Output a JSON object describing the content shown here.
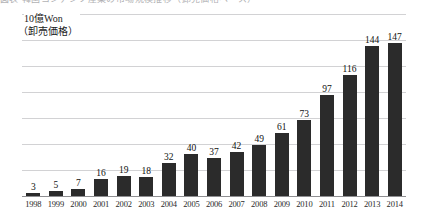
{
  "top_fragment": {
    "text": "図表  韓国コンテンツ産業の市場規模推移（卸売価格ベース）"
  },
  "y_axis_caption": {
    "line1": "10億Won",
    "line2": "（卸売価格）"
  },
  "style": {
    "bar_color": "#2b2b2b",
    "gridline_color": "#d2d2d4",
    "baseline_color": "#8f8f92",
    "label_color": "#111111",
    "background": "#ffffff"
  },
  "chart_data": {
    "type": "bar",
    "title": "",
    "subtitle": "",
    "xlabel": "",
    "ylabel": "10億Won（卸売価格）",
    "categories": [
      "1998",
      "1999",
      "2000",
      "2001",
      "2002",
      "2003",
      "2004",
      "2005",
      "2006",
      "2007",
      "2008",
      "2009",
      "2010",
      "2011",
      "2012",
      "2013",
      "2014"
    ],
    "values": [
      3,
      5,
      7,
      16,
      19,
      18,
      32,
      40,
      37,
      42,
      49,
      61,
      73,
      97,
      116,
      144,
      147
    ],
    "ylim": [
      0,
      175
    ],
    "gridlines": [
      0,
      25,
      50,
      75,
      100,
      125,
      150,
      175
    ],
    "grid": true,
    "legend": "none",
    "data_labels": true
  }
}
